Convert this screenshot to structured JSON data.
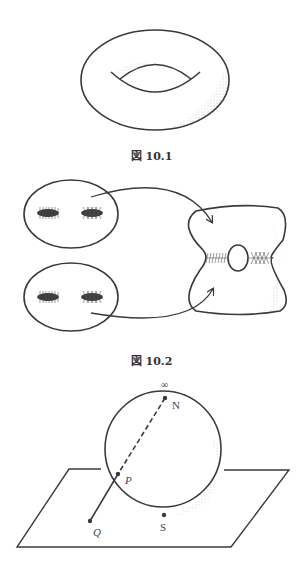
{
  "figures": [
    {
      "id": "fig-10-1",
      "caption": "図 10.1",
      "subject": "torus"
    },
    {
      "id": "fig-10-2",
      "caption": "図 10.2",
      "subject": "two spheres each with two hatched disks glued into a surface with a handle"
    },
    {
      "id": "fig-10-3",
      "caption": "",
      "subject": "stereographic projection of sphere onto plane",
      "labels": {
        "infinity": "∞",
        "north": "N",
        "point_p": "P",
        "point_q": "Q",
        "south": "S"
      }
    }
  ],
  "colors": {
    "stroke": "#3a3a3a",
    "shading": "#9a9a9a",
    "background": "#ffffff"
  }
}
